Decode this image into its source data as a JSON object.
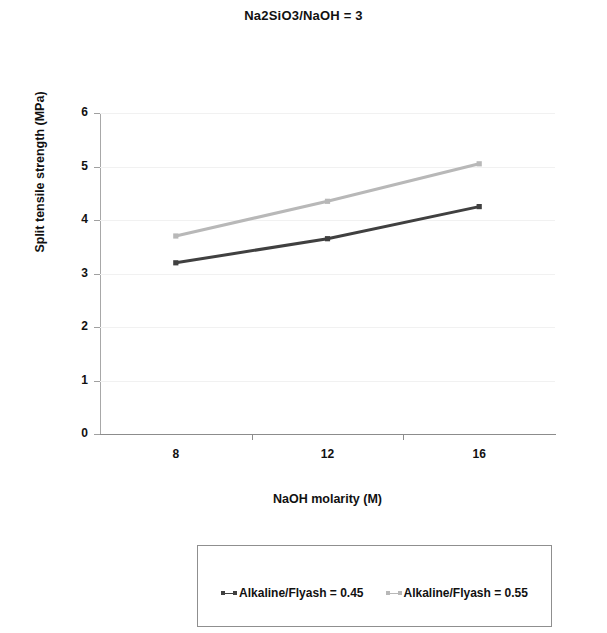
{
  "chart_data": {
    "type": "line",
    "title": "Na2SiO3/NaOH = 3",
    "xlabel": "NaOH molarity (M)",
    "ylabel": "Split tensile strength (MPa)",
    "categories": [
      "8",
      "12",
      "16"
    ],
    "x_values": [
      8,
      12,
      16
    ],
    "ylim": [
      0,
      6
    ],
    "y_ticks": [
      "6",
      "5",
      "4",
      "3",
      "2",
      "1",
      "0"
    ],
    "y_tick_values": [
      6,
      5,
      4,
      3,
      2,
      1,
      0
    ],
    "grid": "horizontal-faint",
    "legend_position": "bottom-box",
    "series": [
      {
        "name": "Alkaline/Flyash = 0.45",
        "values": [
          3.2,
          3.65,
          4.25
        ],
        "color": "#404040",
        "marker": "square"
      },
      {
        "name": "Alkaline/Flyash = 0.55",
        "values": [
          3.7,
          4.35,
          5.05
        ],
        "color": "#b8b8b8",
        "marker": "square"
      }
    ]
  },
  "legend": {
    "entries": [
      {
        "label": "Alkaline/Flyash = 0.45"
      },
      {
        "label": "Alkaline/Flyash = 0.55"
      }
    ]
  },
  "colors": {
    "series_dark": "#404040",
    "series_light": "#b8b8b8",
    "axis": "#8c8c8c",
    "grid": "#f1f1f1",
    "text": "#111111"
  }
}
